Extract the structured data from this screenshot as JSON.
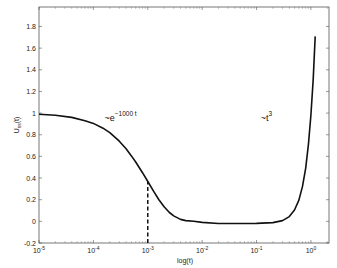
{
  "chart_data": {
    "type": "line",
    "title": "",
    "xlabel": "log(t)",
    "ylabel": "U_ss(t)",
    "xscale": "log",
    "xlim": [
      1e-05,
      2.15
    ],
    "ylim": [
      -0.2,
      1.98
    ],
    "x_ticks": [
      {
        "value": 1e-05,
        "base": "10",
        "exp": "-5"
      },
      {
        "value": 0.0001,
        "base": "10",
        "exp": "-4"
      },
      {
        "value": 0.001,
        "base": "10",
        "exp": "-3"
      },
      {
        "value": 0.01,
        "base": "10",
        "exp": "-2"
      },
      {
        "value": 0.1,
        "base": "10",
        "exp": "-1"
      },
      {
        "value": 1,
        "base": "10",
        "exp": "0"
      }
    ],
    "y_ticks": [
      -0.2,
      0,
      0.2,
      0.4,
      0.6,
      0.8,
      1,
      1.2,
      1.4,
      1.6,
      1.8
    ],
    "y_tick_labels": [
      "-0.2",
      "0",
      "0.2",
      "0.4",
      "0.6",
      "0.8",
      "1",
      "1.2",
      "1.4",
      "1.6",
      "1.8"
    ],
    "grid": false,
    "series": [
      {
        "name": "U_ss(t)",
        "color": "#111111",
        "x": [
          1e-05,
          2e-05,
          4e-05,
          7e-05,
          0.0001,
          0.00015,
          0.0002,
          0.0003,
          0.0004,
          0.0005,
          0.0006,
          0.0008,
          0.001,
          0.0013,
          0.0016,
          0.002,
          0.0025,
          0.003,
          0.004,
          0.005,
          0.007,
          0.01,
          0.02,
          0.05,
          0.1,
          0.2,
          0.3,
          0.4,
          0.5,
          0.6,
          0.7,
          0.8,
          0.9,
          1.0,
          1.1,
          1.2
        ],
        "y": [
          0.99,
          0.98,
          0.96,
          0.93,
          0.905,
          0.86,
          0.82,
          0.74,
          0.67,
          0.605,
          0.548,
          0.449,
          0.368,
          0.272,
          0.2,
          0.135,
          0.082,
          0.05,
          0.018,
          0.007,
          0.0,
          -0.01,
          -0.02,
          -0.02,
          -0.019,
          -0.012,
          0.007,
          0.044,
          0.105,
          0.196,
          0.323,
          0.492,
          0.709,
          0.98,
          1.311,
          1.708
        ]
      }
    ],
    "annotations": [
      {
        "text": "~e",
        "sup": "−1000 t",
        "x": 0.00016,
        "y": 0.93
      },
      {
        "text": "~t",
        "sup": "3",
        "x": 0.12,
        "y": 0.93
      }
    ],
    "reference_lines": [
      {
        "type": "vertical-dashed",
        "x": 0.001,
        "y_from": -0.2,
        "y_to": 0.368
      }
    ]
  }
}
